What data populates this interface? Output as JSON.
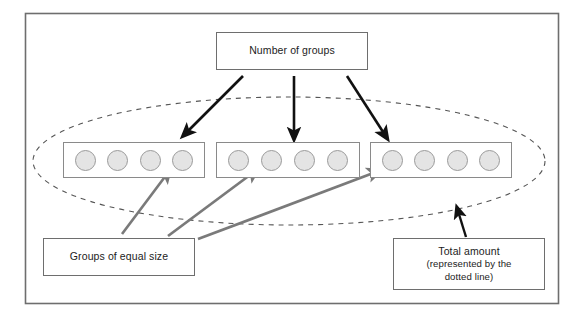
{
  "figure": {
    "outer_frame": {
      "color": "#6e6e6e",
      "x": 25,
      "y": 13,
      "width": 534,
      "height": 291
    },
    "total_ellipse": {
      "name": "dotted-total-ellipse",
      "style": "dashed",
      "color": "#555555",
      "cx": 289,
      "cy": 161,
      "rx": 256,
      "ry": 64
    },
    "labels": {
      "number_of_groups": "Number of groups",
      "groups_of_equal_size": "Groups of equal size",
      "total_amount_line1": "Total amount",
      "total_amount_line2": "(represented by the",
      "total_amount_line3": "dotted line)"
    },
    "groups": [
      {
        "name": "group-1",
        "dot_count": 4
      },
      {
        "name": "group-2",
        "dot_count": 4
      },
      {
        "name": "group-3",
        "dot_count": 4
      }
    ],
    "counts": {
      "number_of_groups": 3,
      "items_per_group": 4,
      "total_items": 12
    },
    "colors": {
      "frame": "#6e6e6e",
      "box_border": "#6e6e6e",
      "group_border": "#8a8a8a",
      "dot_fill": "#e4e4e4",
      "dot_border": "#9a9a9a",
      "black_arrow": "#111111",
      "gray_arrow": "#7a7a7a",
      "dashed_ellipse": "#555555",
      "text": "#1c1c1c",
      "background": "#ffffff"
    },
    "arrows": {
      "black": [
        {
          "name": "arrow-groups-to-group-1",
          "x1": 243,
          "y1": 76,
          "x2": 186,
          "y2": 133
        },
        {
          "name": "arrow-groups-to-group-2",
          "x1": 294,
          "y1": 76,
          "x2": 294,
          "y2": 135
        },
        {
          "name": "arrow-groups-to-group-3",
          "x1": 347,
          "y1": 76,
          "x2": 385,
          "y2": 135
        },
        {
          "name": "arrow-total-to-ellipse",
          "x1": 466,
          "y1": 237,
          "x2": 458,
          "y2": 211
        }
      ],
      "gray": [
        {
          "name": "arrow-equal-size-to-group-1",
          "x1": 122,
          "y1": 234,
          "x2": 167,
          "y2": 174
        },
        {
          "name": "arrow-equal-size-to-group-2",
          "x1": 168,
          "y1": 236,
          "x2": 254,
          "y2": 172
        },
        {
          "name": "arrow-equal-size-to-group-3",
          "x1": 198,
          "y1": 239,
          "x2": 376,
          "y2": 172
        }
      ]
    }
  }
}
